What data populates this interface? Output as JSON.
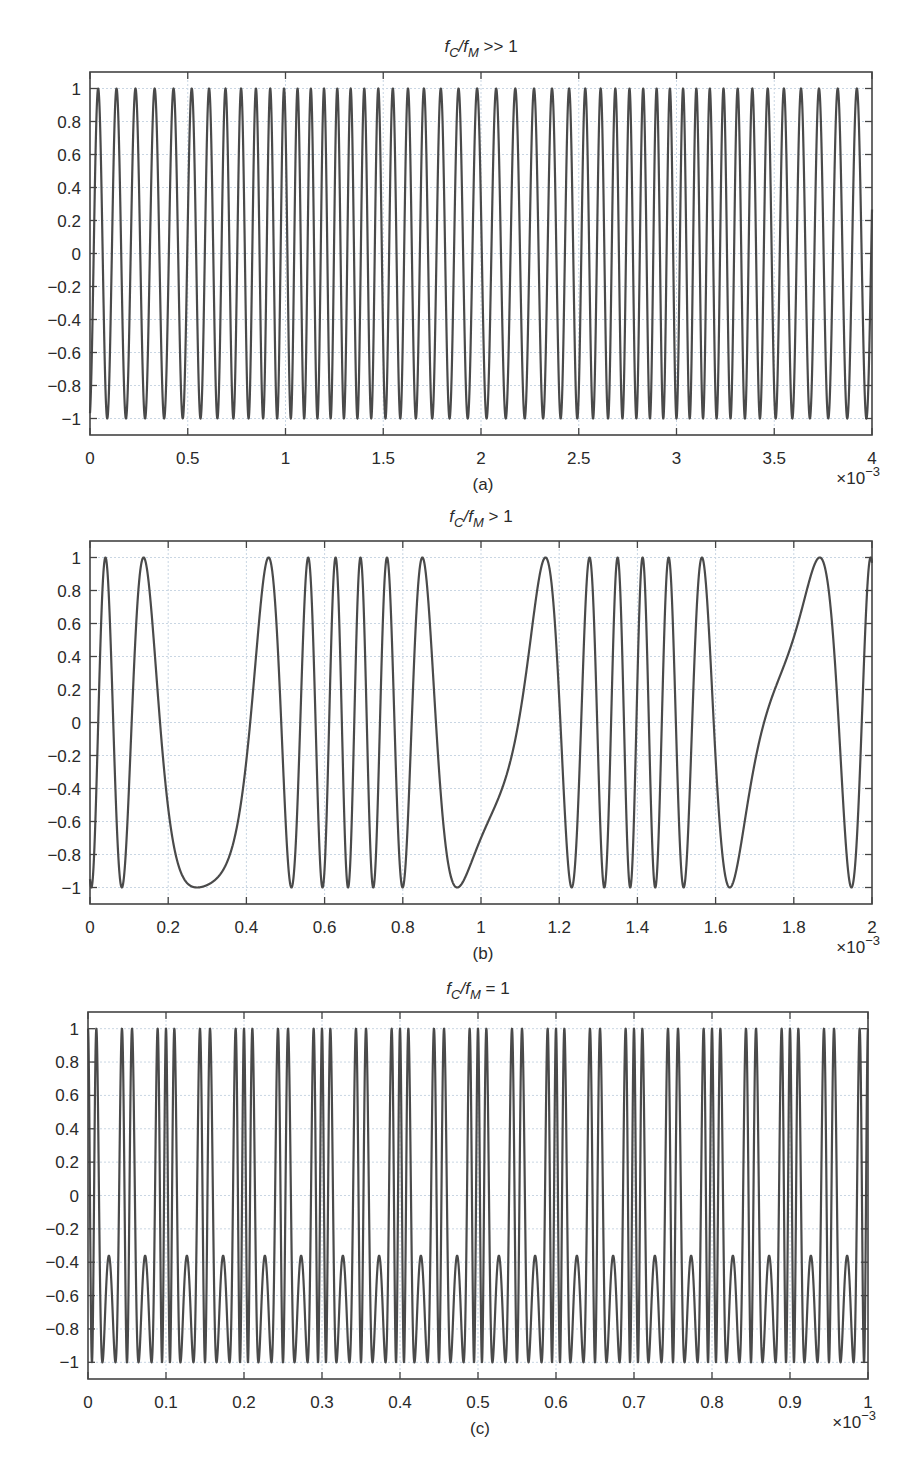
{
  "chart_data": [
    {
      "type": "line",
      "panel": "(a)",
      "title": "f_C/f_M >> 1",
      "title_parts": {
        "f1": "f",
        "s1": "C",
        "sep": "/f",
        "s2": "M",
        "rel": " >> 1"
      },
      "caption": "(a)",
      "xlabel": "",
      "ylabel": "",
      "x_multiplier": "×10⁻³",
      "xlim": [
        0,
        4
      ],
      "ylim": [
        -1.1,
        1.1
      ],
      "xticks": [
        "0",
        "0.5",
        "1",
        "1.5",
        "2",
        "2.5",
        "3",
        "3.5",
        "4"
      ],
      "yticks": [
        "1",
        "0.8",
        "0.6",
        "0.4",
        "0.2",
        "0",
        "−0.2",
        "−0.4",
        "−0.6",
        "−0.8",
        "−1"
      ],
      "grid": true,
      "series": [
        {
          "name": "FM signal",
          "model": "cos(2π·fc·t + β·sin(2π·fm·t))",
          "fc_cycles_per_unit": 12.5,
          "fm_cycles_per_unit": 0.55,
          "beta": 4.2,
          "phase_m": 2.2,
          "amplitude": 1
        }
      ],
      "description": "FM waveform, amplitude ±1, ~50 carrier cycles over 0–4×10⁻³ s with slowly varying instantaneous frequency"
    },
    {
      "type": "line",
      "panel": "(b)",
      "title": "f_C/f_M > 1",
      "title_parts": {
        "f1": "f",
        "s1": "C",
        "sep": "/f",
        "s2": "M",
        "rel": " > 1"
      },
      "caption": "(b)",
      "xlabel": "",
      "ylabel": "",
      "x_multiplier": "×10⁻³",
      "xlim": [
        0,
        2
      ],
      "ylim": [
        -1.1,
        1.1
      ],
      "xticks": [
        "0",
        "0.2",
        "0.4",
        "0.6",
        "0.8",
        "1",
        "1.2",
        "1.4",
        "1.6",
        "1.8",
        "2"
      ],
      "yticks": [
        "1",
        "0.8",
        "0.6",
        "0.4",
        "0.2",
        "0",
        "−0.2",
        "−0.4",
        "−0.6",
        "−0.8",
        "−1"
      ],
      "grid": true,
      "series": [
        {
          "name": "FM signal",
          "model": "cos(2π·fc·t + β·sin(2π·fm·t))",
          "fc_cycles_per_unit": 8.4,
          "fm_cycles_per_unit": 1.37,
          "beta": 5.4,
          "phase_m": 0.55,
          "amplitude": 1
        }
      ],
      "description": "FM waveform with strong deviation; slow half-cycles near 0.37–0.52 and 1.13–1.26 ×10⁻³ s"
    },
    {
      "type": "line",
      "panel": "(c)",
      "title": "f_C/f_M = 1",
      "title_parts": {
        "f1": "f",
        "s1": "C",
        "sep": "/f",
        "s2": "M",
        "rel": " = 1"
      },
      "caption": "(c)",
      "xlabel": "",
      "ylabel": "",
      "x_multiplier": "×10⁻³",
      "xlim": [
        0,
        1
      ],
      "ylim": [
        -1.1,
        1.1
      ],
      "xticks": [
        "0",
        "0.1",
        "0.2",
        "0.3",
        "0.4",
        "0.5",
        "0.6",
        "0.7",
        "0.8",
        "0.9",
        "1"
      ],
      "yticks": [
        "1",
        "0.8",
        "0.6",
        "0.4",
        "0.2",
        "0",
        "−0.2",
        "−0.4",
        "−0.6",
        "−0.8",
        "−1"
      ],
      "grid": true,
      "series": [
        {
          "name": "FM signal",
          "model": "cos(2π·fc·t + β·sin(2π·fm·t))",
          "fc_cycles_per_unit": 10,
          "fm_cycles_per_unit": 10,
          "beta": 9.0,
          "phase_m": 0.0,
          "amplitude": 1
        }
      ],
      "description": "Periodic FM waveform (period 0.1×10⁻³ s); peaks at 1, shallow minima near 0.2, deep minima at −1"
    }
  ],
  "layout": {
    "panels": [
      {
        "left": 90,
        "right": 872,
        "top": 72,
        "bottom": 435,
        "title_y": 52,
        "xtick_y": 458,
        "mult_y": 484,
        "caption_y": 494
      },
      {
        "left": 90,
        "right": 872,
        "top": 541,
        "bottom": 904,
        "title_y": 522,
        "xtick_y": 927,
        "mult_y": 953,
        "caption_y": 963
      },
      {
        "left": 88,
        "right": 868,
        "top": 1012,
        "bottom": 1379,
        "title_y": 994,
        "xtick_y": 1402,
        "mult_y": 1428,
        "caption_y": 1438
      }
    ],
    "colors": {
      "line": "#4a4a4a",
      "grid": "#c9d6e3",
      "frame": "#444444",
      "background": "#ffffff"
    }
  }
}
